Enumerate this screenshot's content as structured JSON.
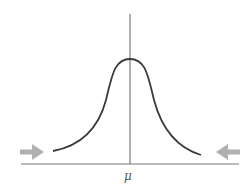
{
  "diagram": {
    "title": "",
    "type": "bell-curve",
    "center_label": "μ",
    "colors": {
      "curve": "#3a3a3a",
      "axis": "#777777",
      "center_line": "#777777",
      "arrows": "#b0b0b0"
    },
    "arrows": [
      {
        "side": "left",
        "direction": "right"
      },
      {
        "side": "right",
        "direction": "left"
      }
    ]
  }
}
